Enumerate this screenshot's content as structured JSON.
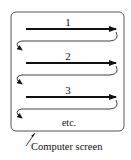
{
  "diagram": {
    "colors": {
      "line": "#111111",
      "frame": "#555555",
      "background": "#ffffff"
    },
    "screen": {
      "x": 11,
      "y": 12,
      "width": 113,
      "height": 119,
      "radius": 5
    },
    "rows": [
      {
        "label": "1",
        "y": 29
      },
      {
        "label": "2",
        "y": 63
      },
      {
        "label": "3",
        "y": 97
      }
    ],
    "continuation_label": "etc.",
    "caption": "Computer screen"
  }
}
